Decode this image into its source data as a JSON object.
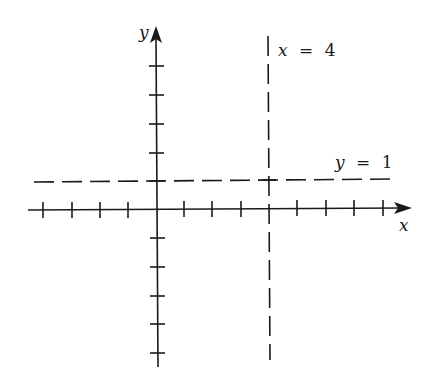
{
  "diagram": {
    "type": "coordinate-plane",
    "axes": {
      "x_label": "x",
      "y_label": "y",
      "x_ticks": [
        -4,
        -3,
        -2,
        -1,
        1,
        2,
        3,
        4,
        5,
        6,
        7,
        8
      ],
      "y_ticks": [
        -5,
        -4,
        -3,
        -2,
        -1,
        1,
        2,
        3,
        4,
        5
      ]
    },
    "asymptotes": [
      {
        "kind": "vertical",
        "equation": "x = 4",
        "lhs": "x",
        "eq": "=",
        "rhs": "4",
        "style": "dashed"
      },
      {
        "kind": "horizontal",
        "equation": "y = 1",
        "lhs": "y",
        "eq": "=",
        "rhs": "1",
        "style": "dashed"
      }
    ],
    "colors": {
      "ink": "#1a1a1a",
      "background": "#ffffff"
    }
  }
}
